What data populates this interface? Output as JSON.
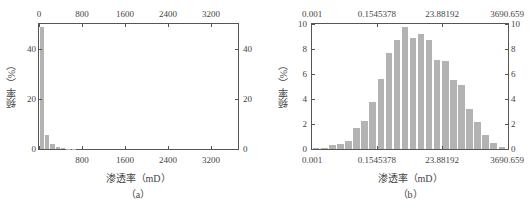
{
  "chart_data": [
    {
      "type": "bar",
      "panel": "(a)",
      "title": "",
      "xlabel": "渗透率（mD）",
      "ylabel": "频率（%）",
      "xlim": [
        0,
        3700
      ],
      "ylim": [
        0,
        50
      ],
      "x_ticks_top": [
        "0",
        "800",
        "1600",
        "2400",
        "3200"
      ],
      "x_ticks_bottom": [
        "800",
        "1600",
        "2400",
        "3200"
      ],
      "y_ticks_left": [
        "0",
        "20",
        "40"
      ],
      "y_ticks_right": [
        "0",
        "20",
        "40"
      ],
      "bin_width": 100,
      "categories": [
        "0-100",
        "100-200",
        "200-300",
        "300-400",
        "400-500",
        "500-600",
        "600-700"
      ],
      "values": [
        49,
        5.5,
        2,
        0.8,
        0.4,
        0.2,
        0.1
      ],
      "grid": false,
      "legend": null
    },
    {
      "type": "bar",
      "panel": "(b)",
      "title": "",
      "xlabel": "渗透率（mD）",
      "ylabel": "频率（%）",
      "x_scale": "log",
      "xlim": [
        0.001,
        3690.659
      ],
      "ylim": [
        0,
        10
      ],
      "x_ticks_top": [
        "0.001",
        "0.1545378",
        "23.88192",
        "3690.659"
      ],
      "x_ticks_bottom": [
        "0.001",
        "0.1545378",
        "23.88192",
        "3690.659"
      ],
      "y_ticks_left": [
        "0",
        "2",
        "4",
        "6",
        "8",
        "10"
      ],
      "y_ticks_right": [
        "0",
        "2",
        "4",
        "6",
        "8",
        "10"
      ],
      "values": [
        0.05,
        0.1,
        0.3,
        0.4,
        0.65,
        1.65,
        2.25,
        3.8,
        5.6,
        7.7,
        8.75,
        9.75,
        8.9,
        9.2,
        8.75,
        7.1,
        7.05,
        5.5,
        5.15,
        3.2,
        2.15,
        1.1,
        0.45,
        0.15
      ],
      "grid": false,
      "legend": null
    }
  ],
  "panels": {
    "a": {
      "label": "（a）",
      "xlabel": "渗透率（mD）",
      "ylabel": "频率（%）",
      "top_ticks": [
        "0",
        "800",
        "1600",
        "2400",
        "3200"
      ],
      "bottom_ticks": [
        "800",
        "1600",
        "2400",
        "3200"
      ],
      "left_ticks": [
        "0",
        "20",
        "40"
      ],
      "right_ticks": [
        "0",
        "20",
        "40"
      ]
    },
    "b": {
      "label": "（b）",
      "xlabel": "渗透率（mD）",
      "ylabel": "频率（%）",
      "top_ticks": [
        "0.001",
        "0.1545378",
        "23.88192",
        "3690.659"
      ],
      "bottom_ticks": [
        "0.001",
        "0.1545378",
        "23.88192",
        "3690.659"
      ],
      "left_ticks": [
        "0",
        "2",
        "4",
        "6",
        "8",
        "10"
      ],
      "right_ticks": [
        "0",
        "2",
        "4",
        "6",
        "8",
        "10"
      ]
    }
  },
  "colors": {
    "bar": "#b3b3b3",
    "axis": "#555555",
    "text": "#444444"
  }
}
